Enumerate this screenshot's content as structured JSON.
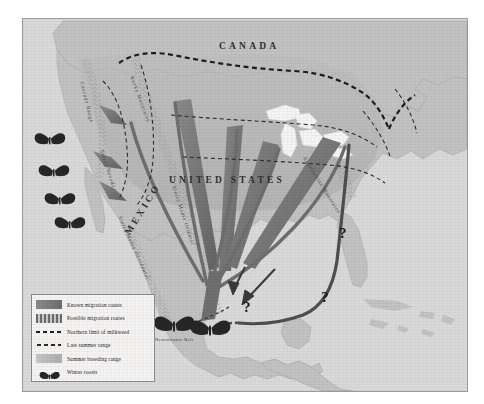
{
  "map": {
    "title_hidden": "",
    "countries": [
      {
        "name": "CANADA",
        "x": 218,
        "y": 30
      },
      {
        "name": "UNITED STATES",
        "x": 168,
        "y": 163
      },
      {
        "name": "MEXICO",
        "x": 128,
        "y": 233
      }
    ],
    "physical_features": [
      {
        "name": "Cascade Range",
        "x": 72,
        "y": 76
      },
      {
        "name": "Rocky Mountains",
        "x": 121,
        "y": 70
      },
      {
        "name": "Sierra Nevada",
        "x": 92,
        "y": 148
      },
      {
        "name": "Sierra Madre Occidental",
        "x": 122,
        "y": 215
      },
      {
        "name": "Sierra Madre Oriental",
        "x": 166,
        "y": 185
      },
      {
        "name": "Appalachian Mountains",
        "x": 310,
        "y": 160
      },
      {
        "name": "Neovolcanic Belt",
        "x": 150,
        "y": 331
      }
    ],
    "question_marks": [
      {
        "label": "?",
        "x": 336,
        "y": 218
      },
      {
        "label": "?",
        "x": 318,
        "y": 281
      },
      {
        "label": "?",
        "x": 240,
        "y": 291
      }
    ],
    "winter_roost_markers": [
      {
        "region": "california-coast",
        "count": 4
      },
      {
        "region": "neovolcanic-belt-mexico",
        "count": 2
      }
    ],
    "colors": {
      "ocean": "#d9d9d9",
      "land": "#c2c2c2",
      "summer_breeding_range": "#b4b4b4",
      "known_route": "#7b7b7b",
      "known_route_dark": "#5e5e5e",
      "great_lakes": "#f2f2f2",
      "border_line": "#9a9a9a",
      "dashed_line": "#1f1f1f",
      "legend_bg": "#f4f3f1"
    }
  },
  "legend": {
    "items": [
      {
        "key": "known-migration-routes",
        "label": "Known migration routes"
      },
      {
        "key": "possible-migration-routes",
        "label": "Possible migration routes"
      },
      {
        "key": "northern-limit-milkweed",
        "label": "Northern limit of milkweed"
      },
      {
        "key": "late-summer-range",
        "label": "Late summer range"
      },
      {
        "key": "summer-breeding-range",
        "label": "Summer breeding range"
      },
      {
        "key": "winter-roosts",
        "label": "Winter roosts"
      }
    ]
  }
}
